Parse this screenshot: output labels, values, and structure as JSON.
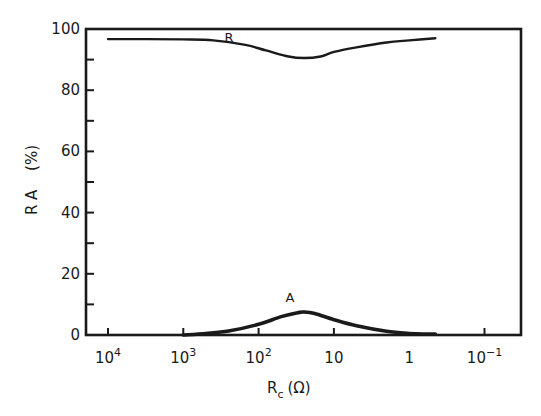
{
  "chart_data": {
    "type": "line",
    "title": "",
    "xlabel": "R_c (Ω)",
    "xlabel_main": "R",
    "xlabel_sub": "c",
    "xlabel_unit": "(Ω)",
    "ylabel": "R A (%)",
    "ylabel_letters": "R A",
    "ylabel_unit": "(%)",
    "x_scale": "log",
    "x_reversed": true,
    "x_ticks": [
      {
        "value": 10000,
        "base": "10",
        "exp": "4"
      },
      {
        "value": 1000,
        "base": "10",
        "exp": "3"
      },
      {
        "value": 100,
        "base": "10",
        "exp": "2"
      },
      {
        "value": 10,
        "base": "10",
        "exp": ""
      },
      {
        "value": 1,
        "base": "1",
        "exp": ""
      },
      {
        "value": 0.1,
        "base": "10",
        "exp": "−1"
      }
    ],
    "xlim": [
      20000,
      0.05
    ],
    "ylim": [
      0,
      100
    ],
    "y_ticks": [
      0,
      20,
      40,
      60,
      80,
      100
    ],
    "y_minor_ticks": [
      10,
      30,
      50,
      70,
      90
    ],
    "grid": false,
    "legend": "inline labels",
    "series": [
      {
        "name": "R",
        "label": "R",
        "x": [
          10000,
          3000,
          1000,
          400,
          150,
          80,
          40,
          25,
          15,
          10,
          5,
          2,
          1,
          0.45
        ],
        "values": [
          96.7,
          96.7,
          96.6,
          96.3,
          94.8,
          93.0,
          91.0,
          90.5,
          91.0,
          92.5,
          94.0,
          95.6,
          96.3,
          97.0
        ]
      },
      {
        "name": "A",
        "label": "A",
        "x": [
          1000,
          500,
          250,
          100,
          50,
          30,
          25,
          18,
          10,
          5,
          2,
          1,
          0.6,
          0.45
        ],
        "values": [
          0.0,
          0.5,
          1.3,
          3.5,
          6.0,
          7.3,
          7.5,
          7.0,
          5.0,
          3.0,
          1.2,
          0.5,
          0.3,
          0.3
        ]
      }
    ]
  }
}
